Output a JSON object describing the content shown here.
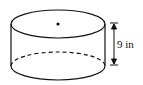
{
  "diagram": {
    "shape": "cylinder",
    "height_label": "9 in",
    "has_center_dot": true,
    "hidden_edge_dashed": true,
    "stroke_color": "#111111"
  }
}
